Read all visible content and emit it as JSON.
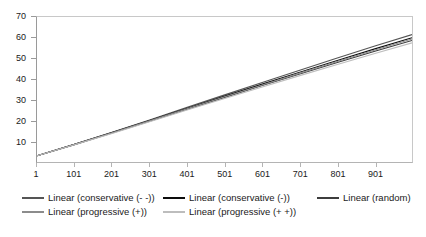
{
  "chart_data": {
    "type": "line",
    "title": "",
    "xlabel": "",
    "ylabel": "",
    "xlim": [
      1,
      1000
    ],
    "ylim": [
      0,
      70
    ],
    "y_ticks": [
      70,
      60,
      50,
      40,
      30,
      20,
      10
    ],
    "x_ticks": [
      1,
      101,
      201,
      301,
      401,
      501,
      601,
      701,
      801,
      901
    ],
    "grid": false,
    "legend_position": "bottom",
    "x": [
      1,
      101,
      201,
      301,
      401,
      501,
      601,
      701,
      801,
      901,
      1000
    ],
    "series": [
      {
        "name": "Linear (conservative (- -))",
        "color": "#555555",
        "values": [
          3.0,
          8.6,
          14.4,
          20.3,
          26.4,
          32.4,
          38.4,
          44.3,
          50.2,
          56.0,
          61.5
        ]
      },
      {
        "name": "Linear (conservative (-))",
        "color": "#0d0d0d",
        "values": [
          3.0,
          8.5,
          14.2,
          20.0,
          25.9,
          31.8,
          37.6,
          43.3,
          49.0,
          54.6,
          60.0
        ]
      },
      {
        "name": "Linear (random)",
        "color": "#3d3d3d",
        "values": [
          3.0,
          8.4,
          14.0,
          19.7,
          25.5,
          31.2,
          36.9,
          42.5,
          48.0,
          53.5,
          58.7
        ]
      },
      {
        "name": "Linear (progressive (+))",
        "color": "#8c8c8c",
        "values": [
          3.0,
          8.5,
          14.1,
          19.9,
          25.7,
          31.5,
          37.2,
          42.9,
          48.5,
          54.1,
          59.4
        ]
      },
      {
        "name": "Linear (progressive (+ +))",
        "color": "#bdbdbd",
        "values": [
          3.0,
          8.3,
          13.8,
          19.4,
          25.1,
          30.7,
          36.2,
          41.7,
          47.1,
          52.4,
          57.5
        ]
      }
    ]
  },
  "legend": {
    "items": [
      {
        "label": "Linear (conservative (- -))",
        "color": "#555555"
      },
      {
        "label": "Linear (conservative (-))",
        "color": "#0d0d0d"
      },
      {
        "label": "Linear (random)",
        "color": "#3d3d3d"
      },
      {
        "label": "Linear (progressive (+))",
        "color": "#8c8c8c"
      },
      {
        "label": "Linear (progressive (+ +))",
        "color": "#bdbdbd"
      }
    ]
  },
  "axes": {
    "y_labels": [
      "70",
      "60",
      "50",
      "40",
      "30",
      "20",
      "10"
    ],
    "x_labels": [
      "1",
      "101",
      "201",
      "301",
      "401",
      "501",
      "601",
      "701",
      "801",
      "901"
    ]
  }
}
